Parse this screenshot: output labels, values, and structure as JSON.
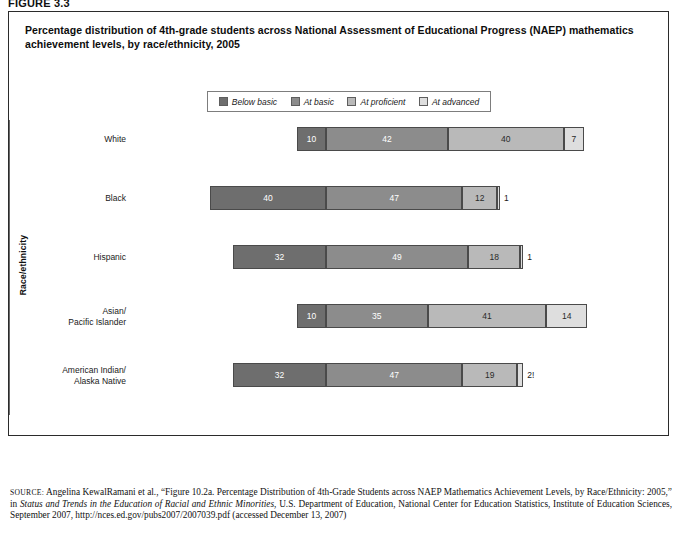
{
  "figure_tag": "FIGURE 3.3",
  "chart_title": "Percentage distribution of 4th-grade students across National Assessment of Educational Progress (NAEP) mathematics achievement levels, by race/ethnicity, 2005",
  "y_axis_title": "Race/ethnicity",
  "axis_caption_left": "Percent below basic",
  "axis_caption_right": "Percent above basic",
  "colors": {
    "below_basic": "#6e6e6e",
    "at_basic": "#8c8c8c",
    "at_proficient": "#b9b9b9",
    "at_advanced": "#dedede",
    "panel_border": "#2b2b2b",
    "zero_line": "#6a6a6a"
  },
  "notes": [
    "! Interpret data with caution.",
    "Note: NAEP reports data on student race/ethnicity based on information obtained from school rosters. Race categories exclude persons of Hispanic origin. Detail may not sum to totals because of rounding."
  ],
  "source": {
    "label": "source:",
    "text": " Angelina KewalRamani et al., “Figure 10.2a. Percentage Distribution of 4th-Grade Students across NAEP Mathematics Achievement Levels, by Race/Ethnicity: 2005,” in ",
    "italic_title": "Status and Trends in the Education of Racial and Ethnic Minorities",
    "text_after": ", U.S. Department of Education, National Center for Education Statistics, Institute of Education Sciences, September 2007, http://nces.ed.gov/pubs2007/2007039.pdf (accessed December 13, 2007)"
  },
  "chart_data": {
    "type": "bar",
    "orientation": "horizontal",
    "stacked": true,
    "diverging": true,
    "title": "Percentage distribution of 4th-grade students across National Assessment of Educational Progress (NAEP) mathematics achievement levels, by race/ethnicity, 2005",
    "xlabel_left": "Percent below basic",
    "xlabel_right": "Percent above basic",
    "ylabel": "Race/ethnicity",
    "grid": false,
    "legend_position": "top-center",
    "xlim": [
      -70,
      100
    ],
    "xticks_left": [
      70,
      60,
      50,
      40,
      30,
      20,
      10,
      0
    ],
    "xticks_right": [
      0,
      10,
      20,
      30,
      40,
      50,
      60,
      70,
      80,
      90,
      100
    ],
    "categories": [
      "White",
      "Black",
      "Hispanic",
      "Asian/\nPacific Islander",
      "American Indian/\nAlaska Native"
    ],
    "series": [
      {
        "name": "Below basic",
        "values": [
          10,
          40,
          32,
          10,
          32
        ]
      },
      {
        "name": "At basic",
        "values": [
          42,
          47,
          49,
          35,
          47
        ]
      },
      {
        "name": "At proficient",
        "values": [
          40,
          12,
          18,
          41,
          19
        ]
      },
      {
        "name": "At advanced",
        "values": [
          7,
          1,
          1,
          14,
          2
        ]
      }
    ],
    "value_labels": [
      [
        "10",
        "42",
        "40",
        "7"
      ],
      [
        "40",
        "47",
        "12",
        "1"
      ],
      [
        "32",
        "49",
        "18",
        "1"
      ],
      [
        "10",
        "35",
        "41",
        "14"
      ],
      [
        "32",
        "47",
        "19",
        "2!"
      ]
    ]
  },
  "legend": {
    "items": [
      {
        "label": "Below basic",
        "color": "#6e6e6e"
      },
      {
        "label": "At basic",
        "color": "#8c8c8c"
      },
      {
        "label": "At proficient",
        "color": "#b9b9b9"
      },
      {
        "label": "At advanced",
        "color": "#dedede"
      }
    ]
  }
}
